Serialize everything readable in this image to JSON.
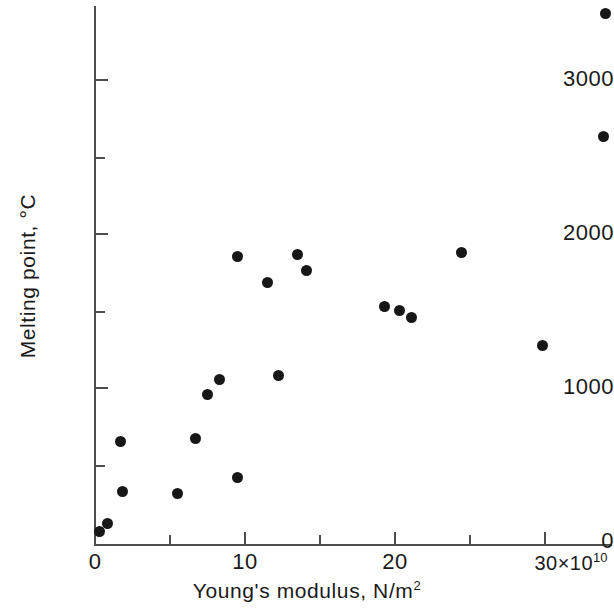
{
  "chart_data": {
    "type": "scatter",
    "title": "",
    "xlabel": "Young's modulus, N/m²",
    "ylabel": "Melting point, °C",
    "x_multiplier": "×10¹⁰",
    "xlim": [
      0,
      34.6
    ],
    "ylim": [
      0,
      3520
    ],
    "grid": false,
    "legend": null,
    "x_ticks_major": [
      0,
      10,
      20,
      30
    ],
    "x_ticks_major_labels": [
      "0",
      "10",
      "20",
      "30×10"
    ],
    "x_ticks_minor": [
      5,
      15,
      25
    ],
    "y_ticks_major": [
      0,
      1000,
      2000,
      3000
    ],
    "y_ticks_major_labels": [
      "0",
      "1000",
      "2000",
      "3000"
    ],
    "y_ticks_minor": [
      500,
      1500,
      2500
    ],
    "marker": "filled-circle",
    "marker_color": "#171717",
    "axis_color": "#4d4d4d",
    "points": [
      {
        "x": 0.3,
        "y": 65
      },
      {
        "x": 0.8,
        "y": 117
      },
      {
        "x": 1.7,
        "y": 650
      },
      {
        "x": 1.8,
        "y": 331
      },
      {
        "x": 5.5,
        "y": 318
      },
      {
        "x": 6.7,
        "y": 669
      },
      {
        "x": 7.5,
        "y": 961
      },
      {
        "x": 8.3,
        "y": 1058
      },
      {
        "x": 9.5,
        "y": 1857
      },
      {
        "x": 9.5,
        "y": 422
      },
      {
        "x": 11.5,
        "y": 1682
      },
      {
        "x": 12.2,
        "y": 1078
      },
      {
        "x": 13.5,
        "y": 1870
      },
      {
        "x": 14.1,
        "y": 1766
      },
      {
        "x": 19.3,
        "y": 1532
      },
      {
        "x": 20.3,
        "y": 1506
      },
      {
        "x": 21.1,
        "y": 1455
      },
      {
        "x": 24.4,
        "y": 1883
      },
      {
        "x": 29.8,
        "y": 1279
      },
      {
        "x": 33.9,
        "y": 2630
      },
      {
        "x": 34.0,
        "y": 3429
      }
    ]
  },
  "axes": {
    "x_title_main": "Young's modulus, N/m",
    "x_title_sup": "2",
    "y_title": "Melting point, °C",
    "x_exponent_base": "30×10",
    "x_exponent_sup": "10"
  },
  "y_tick_labels": [
    "3000",
    "2000",
    "1000",
    "0"
  ],
  "x_tick_labels": [
    "0",
    "10",
    "20"
  ]
}
